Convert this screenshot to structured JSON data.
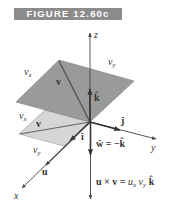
{
  "figure": {
    "title": "FIGURE 12.60c"
  },
  "colors": {
    "banner_bg": "#8c8c8c",
    "banner_text": "#ffffff",
    "upper_plane": "#9a9a9a",
    "lower_plane": "#d6d6d6",
    "axis": "#444444",
    "text": "#333333"
  },
  "axes": {
    "z_label": "z",
    "y_label": "y",
    "x_label": "x"
  },
  "upper_plane": {
    "side_label_x": "v",
    "side_label_x_sub": "x",
    "side_label_y": "v",
    "side_label_y_sub": "y",
    "vector_label": "v"
  },
  "lower_plane": {
    "side_label_x": "v",
    "side_label_x_sub": "x",
    "side_label_y": "v",
    "side_label_y_sub": "y",
    "vector_label": "v"
  },
  "unit_vectors": {
    "i_hat": "î",
    "j_hat": "ĵ",
    "k_hat": "k̂"
  },
  "equations": {
    "w_hat": "ŵ = −k̂",
    "cross_lhs": "u × v =",
    "cross_rhs_u": "u",
    "cross_rhs_u_sub": "x",
    "cross_rhs_v": "v",
    "cross_rhs_v_sub": "y",
    "cross_rhs_k": "k̂"
  },
  "vectors": {
    "u_label": "u"
  }
}
